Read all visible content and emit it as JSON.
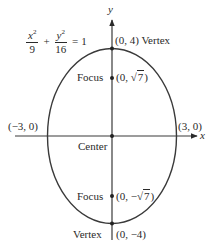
{
  "equation": {
    "term1_num_var": "x",
    "term1_num_exp": "2",
    "term1_den": "9",
    "plus": "+",
    "term2_num_var": "y",
    "term2_num_exp": "2",
    "term2_den": "16",
    "equals": "=",
    "rhs": "1"
  },
  "axes": {
    "x_label": "x",
    "y_label": "y"
  },
  "points": {
    "top_vertex": {
      "coords": "(0, 4)",
      "label": "Vertex"
    },
    "upper_focus": {
      "label": "Focus",
      "coords_prefix": "(0, ",
      "radicand": "7",
      "coords_suffix": ")"
    },
    "left_vertex": {
      "coords": "(−3, 0)"
    },
    "right_vertex": {
      "coords": "(3, 0)"
    },
    "center": {
      "label": "Center"
    },
    "lower_focus": {
      "label": "Focus",
      "coords_prefix": "(0, −",
      "radicand": "7",
      "coords_suffix": ")"
    },
    "bottom_vertex": {
      "coords": "(0, −4)",
      "label": "Vertex"
    }
  },
  "style": {
    "stroke_color": "#3a3a3a",
    "background": "#ffffff"
  }
}
